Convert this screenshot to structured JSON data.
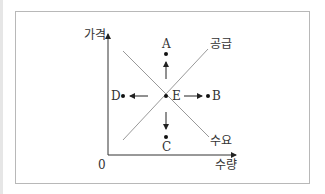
{
  "diagram": {
    "y_axis_label": "가격",
    "x_axis_label": "수량",
    "origin_label": "0",
    "curves": {
      "supply": "공급",
      "demand": "수요"
    },
    "points": {
      "A": "A",
      "B": "B",
      "C": "C",
      "D": "D",
      "E": "E"
    }
  }
}
